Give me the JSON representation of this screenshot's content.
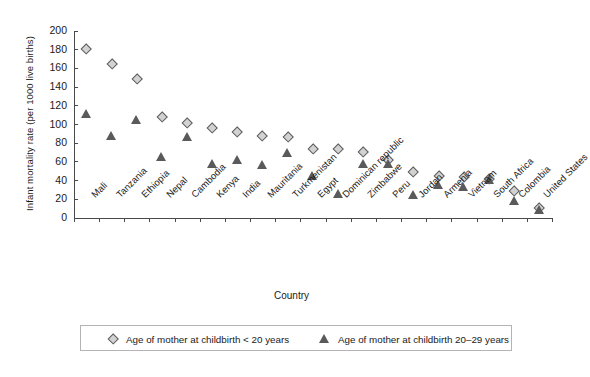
{
  "chart_data": {
    "type": "scatter",
    "title": "",
    "xlabel": "Country",
    "ylabel": "Infant mortality rate (per 1000 live births)",
    "ylim": [
      0,
      200
    ],
    "yticks": [
      0,
      20,
      40,
      60,
      80,
      100,
      120,
      140,
      160,
      180,
      200
    ],
    "grid": false,
    "legend_position": "bottom",
    "categories": [
      "Mali",
      "Tanzania",
      "Ethiopia",
      "Nepal",
      "Cambodia",
      "Kenya",
      "India",
      "Mauritania",
      "Turkmenistan",
      "Egypt",
      "Dominican republic",
      "Zimbabwe",
      "Peru",
      "Jordan",
      "Armenia",
      "Vietnam",
      "South Africa",
      "Colombia",
      "United States"
    ],
    "series": [
      {
        "name": "Age of mother at childbirth < 20 years",
        "marker": "diamond",
        "color": "#d2d2d2",
        "edge_color": "#5b5b5b",
        "values": [
          181,
          165,
          148,
          108,
          101,
          96,
          92,
          87,
          86,
          74,
          74,
          70,
          62,
          49,
          45,
          44,
          42,
          29,
          11
        ]
      },
      {
        "name": "Age of mother at childbirth 20–29 years",
        "marker": "triangle",
        "color": "#5a5a5a",
        "edge_color": "#4a4a4a",
        "values": [
          111,
          87,
          104,
          65,
          86,
          57,
          62,
          56,
          69,
          44,
          25,
          57,
          57,
          24,
          35,
          33,
          40,
          18,
          8
        ]
      }
    ]
  },
  "legend": {
    "entries": [
      {
        "label": "Age of mother at childbirth < 20 years",
        "marker": "diamond-marker-icon"
      },
      {
        "label": "Age of mother at childbirth 20–29 years",
        "marker": "triangle-marker-icon"
      }
    ]
  },
  "axes": {
    "y_title": "Infant mortality rate (per 1000 live births)",
    "x_title": "Country"
  }
}
